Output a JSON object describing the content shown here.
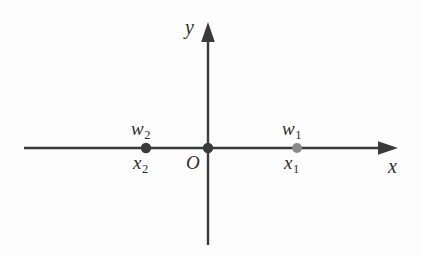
{
  "figure": {
    "background_color": "#fdfdfd",
    "axis_color": "#3a3a3a",
    "label_color": "#2e2e2e",
    "point_dark_color": "#3a3a3a",
    "point_light_color": "#8a8a8a"
  },
  "axes": {
    "x_axis": {
      "name": "x",
      "label": "x",
      "orientation": "horizontal",
      "start_x": 24,
      "end_x": 398,
      "y": 148,
      "arrow": "right"
    },
    "y_axis": {
      "name": "y",
      "label": "y",
      "orientation": "vertical",
      "x": 208,
      "top_y": 22,
      "bottom_y": 245,
      "arrow": "up"
    }
  },
  "origin": {
    "label": "O",
    "x": 208,
    "y": 148,
    "color": "#3a3a3a"
  },
  "points": [
    {
      "id": "point-x2",
      "lower_label_base": "x",
      "lower_label_sub": "2",
      "upper_label_base": "w",
      "upper_label_sub": "2",
      "x": 146,
      "y": 148,
      "color": "#3a3a3a",
      "radius": 5.2
    },
    {
      "id": "point-x1",
      "lower_label_base": "x",
      "lower_label_sub": "1",
      "upper_label_base": "w",
      "upper_label_sub": "1",
      "x": 297,
      "y": 148,
      "color": "#8a8a8a",
      "radius": 5.0
    }
  ]
}
